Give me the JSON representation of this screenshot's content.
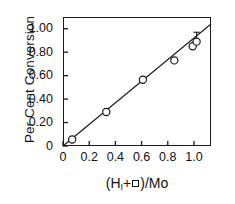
{
  "chart_data": {
    "type": "scatter",
    "title": "",
    "xlabel": "(H_I + □)/Mo",
    "ylabel": "Per Cent Conversion",
    "xlim": [
      0,
      1.13
    ],
    "ylim": [
      0,
      1.1
    ],
    "grid": false,
    "legend": null,
    "xticks": [
      0,
      0.2,
      0.4,
      0.6,
      0.8,
      1.0
    ],
    "xtick_labels": [
      "0",
      "0.2",
      "0.4",
      "0.6",
      "0.8",
      "1.0"
    ],
    "yticks": [
      0,
      0.2,
      0.4,
      0.6,
      0.8,
      1.0
    ],
    "ytick_labels": [
      "0",
      "0.20",
      "0.40",
      "0.60",
      "0.80",
      "1.00"
    ],
    "marker": "open-circle",
    "points": [
      {
        "x": 0.07,
        "y": 0.055,
        "yerr": 0
      },
      {
        "x": 0.33,
        "y": 0.29,
        "yerr": 0
      },
      {
        "x": 0.61,
        "y": 0.565,
        "yerr": 0
      },
      {
        "x": 0.85,
        "y": 0.73,
        "yerr": 0
      },
      {
        "x": 0.99,
        "y": 0.85,
        "yerr": 0
      },
      {
        "x": 1.02,
        "y": 0.89,
        "yerr": 0.08
      }
    ],
    "fit_line": {
      "x_start": 0.0,
      "y_start": 0.0,
      "x_end": 1.13,
      "y_end": 1.04,
      "slope": 0.92,
      "intercept": 0.0
    }
  },
  "axis": {
    "ylabel_text": "Per Cent Conversion",
    "xlabel_open_paren": "(H",
    "xlabel_sub": "I",
    "xlabel_plus": "+",
    "xlabel_close": ")/Mo"
  }
}
